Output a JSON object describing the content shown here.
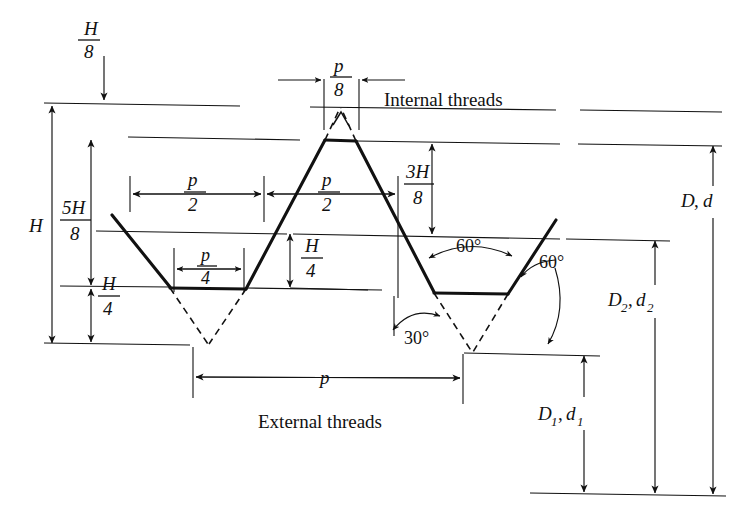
{
  "figure": {
    "kind": "unified-screw-thread-profile-diagram",
    "background": "#ffffff",
    "ink": "#111111"
  },
  "captions": {
    "internal_threads": "Internal threads",
    "external_threads": "External threads"
  },
  "dimensions": {
    "H_total": {
      "num": "H",
      "den": ""
    },
    "H_over_8": {
      "num": "H",
      "den": "8"
    },
    "five_H_over_8": {
      "num": "5H",
      "den": "8"
    },
    "three_H_over_8": {
      "num": "3H",
      "den": "8"
    },
    "H_over_4_left": {
      "num": "H",
      "den": "4"
    },
    "H_over_4_center": {
      "num": "H",
      "den": "4"
    },
    "p_over_8": {
      "num": "p",
      "den": "8"
    },
    "p_over_2_left": {
      "num": "p",
      "den": "2"
    },
    "p_over_2_right": {
      "num": "p",
      "den": "2"
    },
    "p_over_4": {
      "num": "p",
      "den": "4"
    },
    "pitch": "p"
  },
  "angles": {
    "included_60": "60°",
    "flank_60": "60°",
    "half_30": "30°"
  },
  "diameters": {
    "major": "D, d",
    "pitch": "D₂, d₂",
    "minor": "D₁, d₁",
    "major_parts": {
      "base": "D",
      "sub": "",
      "base2": "d",
      "sub2": ""
    },
    "pitch_parts": {
      "base": "D",
      "sub": "2",
      "base2": "d",
      "sub2": "2"
    },
    "minor_parts": {
      "base": "D",
      "sub": "1",
      "base2": "d",
      "sub2": "1"
    }
  }
}
